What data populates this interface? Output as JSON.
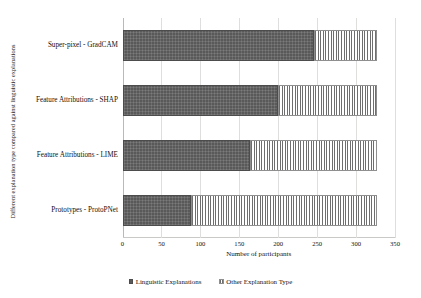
{
  "chart_data": {
    "type": "bar",
    "orientation": "horizontal",
    "stacked": true,
    "title": "",
    "xlabel": "Number of participants",
    "ylabel": "Different explanation type compared against linguistic explanations",
    "categories": [
      "Super-pixel - GradCAM",
      "Feature Attributions - SHAP",
      "Feature Attributions - LIME",
      "Prototypes - ProtoPNet"
    ],
    "series": [
      {
        "name": "Linguistic Explanations",
        "values": [
          246,
          200,
          164,
          88
        ],
        "color": "#595959",
        "pattern": "checkerboard"
      },
      {
        "name": "Other Explanation Type",
        "values": [
          81,
          127,
          163,
          239
        ],
        "color": "#6e6e6e",
        "pattern": "vertical-stripes"
      }
    ],
    "totals": [
      327,
      327,
      327,
      327
    ],
    "xlim": [
      0,
      350
    ],
    "xticks": [
      0,
      50,
      100,
      150,
      200,
      250,
      300,
      350
    ],
    "xtick_labels": [
      "0",
      "50",
      "100",
      "150",
      "200",
      "250",
      "300",
      "350"
    ],
    "grid": true,
    "grid_axis": "x",
    "legend_position": "bottom-center"
  },
  "legend": {
    "items": [
      {
        "label": "Linguistic Explanations",
        "swatch": "solid-dark-square-icon"
      },
      {
        "label": "Other Explanation Type",
        "swatch": "striped-square-icon"
      }
    ]
  }
}
